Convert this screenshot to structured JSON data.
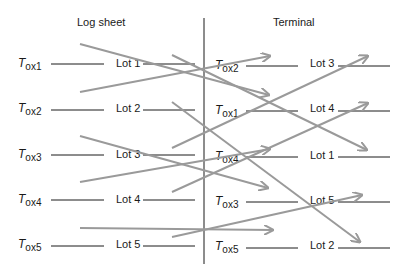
{
  "headers": {
    "left": "Log sheet",
    "right": "Terminal"
  },
  "left_rows": [
    {
      "tox": "T",
      "sub": "ox1",
      "lot": "Lot 1"
    },
    {
      "tox": "T",
      "sub": "ox2",
      "lot": "Lot 2"
    },
    {
      "tox": "T",
      "sub": "ox3",
      "lot": "Lot 3"
    },
    {
      "tox": "T",
      "sub": "ox4",
      "lot": "Lot 4"
    },
    {
      "tox": "T",
      "sub": "ox5",
      "lot": "Lot 5"
    }
  ],
  "right_rows": [
    {
      "tox": "T",
      "sub": "ox2",
      "lot": "Lot 3"
    },
    {
      "tox": "T",
      "sub": "ox1",
      "lot": "Lot 4"
    },
    {
      "tox": "T",
      "sub": "ox4",
      "lot": "Lot 1"
    },
    {
      "tox": "T",
      "sub": "ox3",
      "lot": "Lot 5"
    },
    {
      "tox": "T",
      "sub": "ox5",
      "lot": "Lot 2"
    }
  ],
  "colors": {
    "arrow": "#9a9a9a",
    "line": "#1a1a1a"
  }
}
